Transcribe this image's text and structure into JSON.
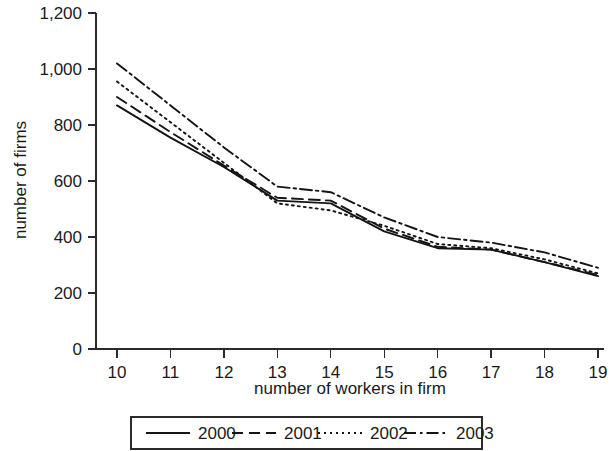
{
  "chart_data": {
    "type": "line",
    "title": "",
    "xlabel": "number of workers in firm",
    "ylabel": "number of firms",
    "x": [
      10,
      11,
      12,
      13,
      14,
      15,
      16,
      17,
      18,
      19
    ],
    "xtick_labels": [
      "10",
      "11",
      "12",
      "13",
      "14",
      "15",
      "16",
      "17",
      "18",
      "19"
    ],
    "ytick_labels": [
      "0",
      "200",
      "400",
      "600",
      "800",
      "1,000",
      "1,200"
    ],
    "ytick_values": [
      0,
      200,
      400,
      600,
      800,
      1000,
      1200
    ],
    "xlim": [
      10,
      19
    ],
    "ylim": [
      0,
      1200
    ],
    "grid": false,
    "legend_position": "bottom",
    "series": [
      {
        "name": "2000",
        "style": "solid",
        "values": [
          870,
          755,
          650,
          530,
          520,
          420,
          360,
          355,
          310,
          260
        ]
      },
      {
        "name": "2001",
        "style": "dashed",
        "values": [
          900,
          775,
          655,
          540,
          530,
          430,
          365,
          355,
          310,
          265
        ]
      },
      {
        "name": "2002",
        "style": "dotted",
        "values": [
          955,
          810,
          665,
          520,
          495,
          440,
          375,
          360,
          320,
          270
        ]
      },
      {
        "name": "2003",
        "style": "dash-dot",
        "values": [
          1020,
          870,
          720,
          580,
          560,
          470,
          400,
          380,
          345,
          290
        ]
      }
    ]
  },
  "legend": {
    "items": [
      {
        "label": "2000",
        "style": "solid"
      },
      {
        "label": "2001",
        "style": "dashed"
      },
      {
        "label": "2002",
        "style": "dotted"
      },
      {
        "label": "2003",
        "style": "dash-dot"
      }
    ]
  },
  "colors": {
    "ink": "#141414",
    "axis": "#2b2b2b",
    "background": "#ffffff"
  }
}
